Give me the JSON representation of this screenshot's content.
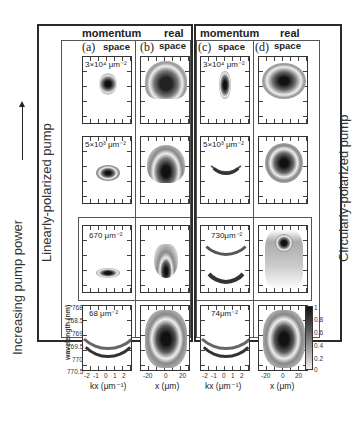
{
  "figure": {
    "side_labels": {
      "left_outer": "Increasing pump power",
      "left_inner": "Linearly-polarized pump",
      "right": "Circularly-polarized pump"
    },
    "group_headers": [
      {
        "momentum": "momentum",
        "real": "real"
      },
      {
        "momentum": "momentum",
        "real": "real"
      }
    ],
    "columns": [
      {
        "letter": "(a)",
        "space": "space"
      },
      {
        "letter": "(b)",
        "space": "space"
      },
      {
        "letter": "(c)",
        "space": "space"
      },
      {
        "letter": "(d)",
        "space": "space"
      }
    ],
    "rows": [
      {
        "linear_density": "3×10⁴ μm⁻²",
        "circular_density": "3×10⁴ μm⁻²"
      },
      {
        "linear_density": "5×10³ μm⁻²",
        "circular_density": "5×10³ μm⁻²"
      },
      {
        "linear_density": "670 μm⁻²",
        "circular_density": "730μm⁻²"
      },
      {
        "linear_density": "68 μm⁻²",
        "circular_density": "74μm⁻²"
      }
    ],
    "wavelength_axis": {
      "label": "wavelength (nm)",
      "ticks": [
        "768",
        "768.5",
        "769",
        "769.5",
        "770",
        "770.5"
      ]
    },
    "kx_axis": {
      "label": "kx (μm⁻¹)",
      "ticks": [
        "-2",
        "-1",
        "0",
        "1",
        "2"
      ]
    },
    "x_axis": {
      "label": "x (μm)",
      "ticks": [
        "-20",
        "0",
        "20"
      ]
    },
    "colorbar": {
      "ticks": [
        "1",
        "0.8",
        "0.6",
        "0.4",
        "0.2",
        "0"
      ]
    }
  }
}
